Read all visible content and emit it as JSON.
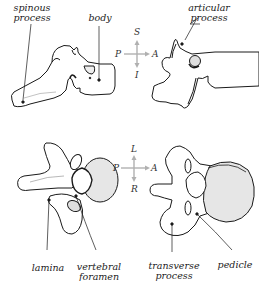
{
  "diagram": {
    "views": [
      {
        "id": "lateral-left",
        "labels": [
          "spinous process",
          "body"
        ]
      },
      {
        "id": "lateral-right",
        "labels": [
          "articular process"
        ]
      },
      {
        "id": "superior-left",
        "labels": [
          "lamina",
          "vertebral foramen"
        ]
      },
      {
        "id": "superior-right",
        "labels": [
          "transverse process",
          "pedicle"
        ]
      }
    ],
    "labels": {
      "spinous_line1": "spinous",
      "spinous_line2": "process",
      "body": "body",
      "articular_line1": "articular",
      "articular_line2": "process",
      "lamina": "lamina",
      "foramen_line1": "vertebral",
      "foramen_line2": "foramen",
      "transverse_line1": "transverse",
      "transverse_line2": "process",
      "pedicle": "pedicle"
    },
    "compass_top": {
      "up": "S",
      "down": "I",
      "left": "P",
      "right": "A"
    },
    "compass_bottom": {
      "up": "L",
      "down": "R",
      "left": "P",
      "right": "A"
    },
    "colors": {
      "outline": "#1a1a1a",
      "fill": "#ffffff",
      "body_shade": "#e6e6e6",
      "compass_arrow": "#b0b0b0",
      "label_text": "#222222"
    }
  }
}
